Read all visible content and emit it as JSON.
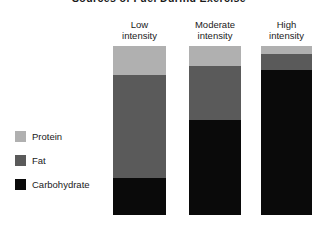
{
  "chart_data": {
    "type": "bar",
    "subtype": "stacked-bar-100",
    "title": "Sources of Fuel During Exercise",
    "xlabel": "",
    "ylabel": "",
    "ylim": [
      0,
      100
    ],
    "grid": false,
    "legend_position": "left",
    "categories": [
      "Low intensity",
      "Moderate intensity",
      "High intensity"
    ],
    "category_lines": [
      [
        "Low",
        "intensity"
      ],
      [
        "Moderate",
        "intensity"
      ],
      [
        "High",
        "intensity"
      ]
    ],
    "series": [
      {
        "name": "Protein",
        "color": "#b0b0b0",
        "values": [
          17,
          12,
          5
        ]
      },
      {
        "name": "Fat",
        "color": "#5a5a5a",
        "values": [
          61,
          32,
          9
        ]
      },
      {
        "name": "Carbohydrate",
        "color": "#0a0a0a",
        "values": [
          22,
          56,
          86
        ]
      }
    ],
    "stack_order_top_to_bottom": [
      "Protein",
      "Fat",
      "Carbohydrate"
    ]
  },
  "legend": {
    "items": [
      {
        "label": "Protein",
        "color": "#b0b0b0"
      },
      {
        "label": "Fat",
        "color": "#5a5a5a"
      },
      {
        "label": "Carbohydrate",
        "color": "#0a0a0a"
      }
    ]
  },
  "bars": [
    {
      "label_line1": "Low",
      "label_line2": "intensity",
      "left": 113,
      "width": 53,
      "height": 169,
      "segments": [
        {
          "name": "Protein",
          "pct": 17,
          "color": "#b0b0b0"
        },
        {
          "name": "Fat",
          "pct": 61,
          "color": "#5a5a5a"
        },
        {
          "name": "Carbohydrate",
          "pct": 22,
          "color": "#0a0a0a"
        }
      ]
    },
    {
      "label_line1": "Moderate",
      "label_line2": "intensity",
      "left": 189,
      "width": 52,
      "height": 169,
      "segments": [
        {
          "name": "Protein",
          "pct": 12,
          "color": "#b0b0b0"
        },
        {
          "name": "Fat",
          "pct": 32,
          "color": "#5a5a5a"
        },
        {
          "name": "Carbohydrate",
          "pct": 56,
          "color": "#0a0a0a"
        }
      ]
    },
    {
      "label_line1": "High",
      "label_line2": "intensity",
      "left": 261,
      "width": 51,
      "height": 169,
      "segments": [
        {
          "name": "Protein",
          "pct": 5,
          "color": "#b0b0b0"
        },
        {
          "name": "Fat",
          "pct": 9,
          "color": "#5a5a5a"
        },
        {
          "name": "Carbohydrate",
          "pct": 86,
          "color": "#0a0a0a"
        }
      ]
    }
  ]
}
